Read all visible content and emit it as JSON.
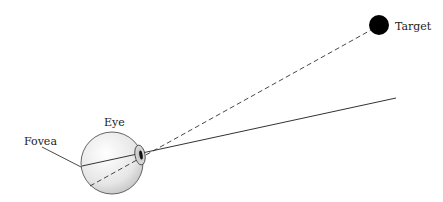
{
  "diagram": {
    "labels": {
      "target": "Target",
      "eye": "Eye",
      "fovea": "Fovea"
    },
    "colors": {
      "line": "#333333",
      "target_fill": "#000000",
      "eye_fill": "#e8e8e8",
      "eye_stroke": "#444444"
    }
  }
}
